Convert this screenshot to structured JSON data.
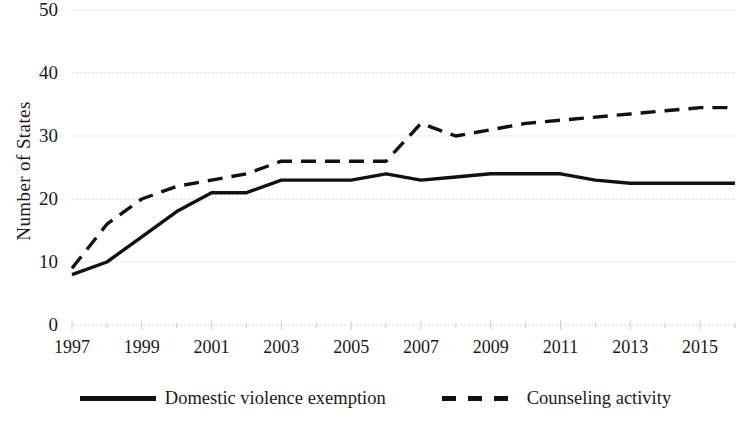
{
  "chart_data": {
    "type": "line",
    "title": "",
    "xlabel": "",
    "ylabel": "Number of States",
    "xlim": [
      1997,
      2016
    ],
    "ylim": [
      0,
      50
    ],
    "grid": true,
    "grid_axis": "y",
    "legend_position": "bottom",
    "y_ticks": [
      50,
      40,
      30,
      20,
      10,
      0
    ],
    "x_ticks": [
      1997,
      1999,
      2001,
      2003,
      2005,
      2007,
      2009,
      2011,
      2013,
      2015
    ],
    "x": [
      1997,
      1998,
      1999,
      2000,
      2001,
      2002,
      2003,
      2004,
      2005,
      2006,
      2007,
      2008,
      2009,
      2010,
      2011,
      2012,
      2013,
      2014,
      2015,
      2016
    ],
    "series": [
      {
        "name": "Domestic violence exemption",
        "style": "solid",
        "color": "#111111",
        "values": [
          8,
          10,
          14,
          18,
          21,
          21,
          23,
          23,
          23,
          24,
          23,
          23.5,
          24,
          24,
          24,
          23,
          22.5,
          22.5,
          22.5,
          22.5
        ]
      },
      {
        "name": "Counseling activity",
        "style": "dashed",
        "color": "#111111",
        "values": [
          9,
          16,
          20,
          22,
          23,
          24,
          26,
          26,
          26,
          26,
          32,
          30,
          31,
          32,
          32.5,
          33,
          33.5,
          34,
          34.5,
          34.5
        ]
      }
    ],
    "legend": [
      {
        "label": "Domestic violence exemption",
        "style": "solid"
      },
      {
        "label": "Counseling activity",
        "style": "dashed"
      }
    ]
  }
}
